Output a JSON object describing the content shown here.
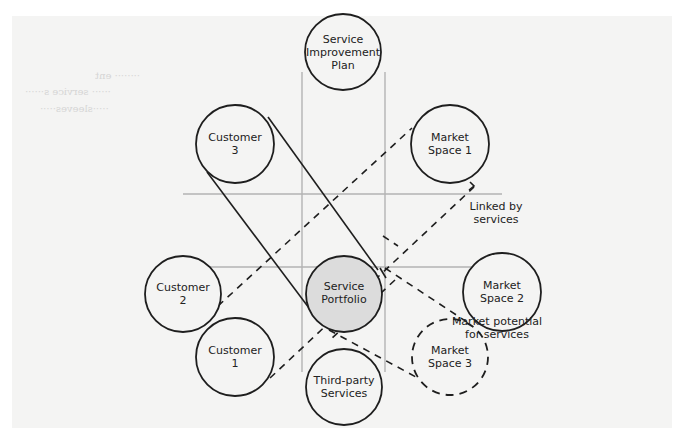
{
  "diagram": {
    "title": "",
    "colors": {
      "panel": "#f4f4f3",
      "stroke": "#1e1e1e",
      "grid": "#b3b3b3",
      "center_fill": "#dcdcdc"
    },
    "nodes": [
      {
        "id": "service-improvement-plan",
        "lines": [
          "Service",
          "Improvement",
          "Plan"
        ],
        "style": "solid"
      },
      {
        "id": "customer-3",
        "lines": [
          "Customer",
          "3"
        ],
        "style": "solid"
      },
      {
        "id": "market-space-1",
        "lines": [
          "Market",
          "Space 1"
        ],
        "style": "solid"
      },
      {
        "id": "customer-2",
        "lines": [
          "Customer",
          "2"
        ],
        "style": "solid"
      },
      {
        "id": "service-portfolio",
        "lines": [
          "Service",
          "Portfolio"
        ],
        "style": "filled"
      },
      {
        "id": "market-space-2",
        "lines": [
          "Market",
          "Space 2"
        ],
        "style": "solid"
      },
      {
        "id": "customer-1",
        "lines": [
          "Customer",
          "1"
        ],
        "style": "solid"
      },
      {
        "id": "third-party-services",
        "lines": [
          "Third-party",
          "Services"
        ],
        "style": "solid"
      },
      {
        "id": "market-space-3",
        "lines": [
          "Market",
          "Space 3"
        ],
        "style": "dashed"
      }
    ],
    "annotations": [
      {
        "id": "linked-by-services",
        "lines": [
          "Linked by",
          "services"
        ]
      },
      {
        "id": "market-potential",
        "lines": [
          "Market potential",
          "for services"
        ]
      }
    ],
    "connections": [
      {
        "from": "customer-3",
        "to": "service-portfolio",
        "style": "solid-band"
      },
      {
        "from": "customer-1",
        "to": "market-space-1",
        "style": "dashed-band"
      },
      {
        "from": "service-portfolio",
        "to": "market-space-3",
        "style": "dashed-band"
      },
      {
        "from": "service-improvement-plan",
        "to": "third-party-services",
        "style": "grid-band-vertical"
      },
      {
        "from": "customer-2",
        "to": "market-space-2",
        "style": "grid-band-horizontal"
      }
    ]
  }
}
